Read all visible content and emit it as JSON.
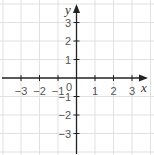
{
  "diagram": {
    "type": "coordinate-plane",
    "x_axis": {
      "label": "x",
      "min": -3,
      "max": 3,
      "ticks": [
        "-3",
        "-2",
        "-1",
        "1",
        "2",
        "3"
      ]
    },
    "y_axis": {
      "label": "y",
      "min": -3,
      "max": 3,
      "ticks": [
        "3",
        "2",
        "1",
        "-1",
        "-2",
        "-3"
      ]
    },
    "origin_label": "0",
    "grid": true,
    "colors": {
      "grid": "#d9d9d9",
      "axis": "#222222",
      "labels": "#555555"
    }
  },
  "labels": {
    "x_axis": "x",
    "y_axis": "y",
    "origin": "0",
    "xt_m3": "−3",
    "xt_m2": "−2",
    "xt_m1": "−1",
    "xt_1": "1",
    "xt_2": "2",
    "xt_3": "3",
    "yt_3": "3",
    "yt_2": "2",
    "yt_1": "1",
    "yt_m1": "−1",
    "yt_m2": "−2",
    "yt_m3": "−3"
  }
}
